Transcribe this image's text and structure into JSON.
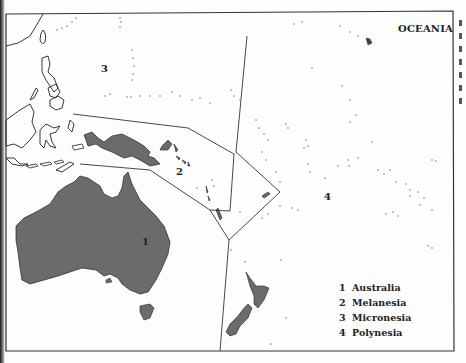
{
  "map": {
    "title": "OCEANIA",
    "region_labels": [
      {
        "id": "1",
        "x": 142,
        "y": 236
      },
      {
        "id": "2",
        "x": 176,
        "y": 166
      },
      {
        "id": "3",
        "x": 101,
        "y": 63
      },
      {
        "id": "4",
        "x": 324,
        "y": 191
      }
    ],
    "legend": [
      {
        "number": "1",
        "name": "Australia"
      },
      {
        "number": "2",
        "name": "Melanesia"
      },
      {
        "number": "3",
        "name": "Micronesia"
      },
      {
        "number": "4",
        "name": "Polynesia"
      }
    ],
    "colors": {
      "land_fill": "#6b6b6b",
      "outline": "#222222",
      "background": "#fdfdfd"
    }
  }
}
